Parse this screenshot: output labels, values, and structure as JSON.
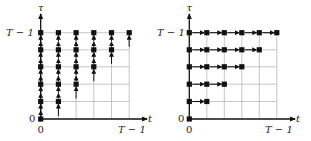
{
  "panels": [
    {
      "name": "left",
      "description": "Vertical dependency arrows (tau direction)",
      "axis_y_label": "τ",
      "axis_x_label": "t",
      "y_top_tick": "T − 1",
      "y_origin_tick": "0",
      "x_origin_tick": "0",
      "x_end_tick": "T − 1",
      "arrow_direction": "up"
    },
    {
      "name": "right",
      "description": "Horizontal dependency arrows (t direction)",
      "axis_y_label": "τ",
      "axis_x_label": "t",
      "y_top_tick": "T − 1",
      "y_origin_tick": "0",
      "x_origin_tick": "0",
      "x_end_tick": "T − 1",
      "arrow_direction": "right"
    }
  ],
  "grid_size": 6,
  "colors": {
    "grid": "#b8b8b8",
    "axis": "#111111",
    "node": "#111111"
  }
}
